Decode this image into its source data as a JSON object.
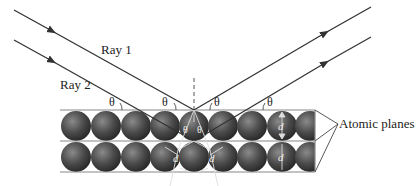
{
  "diagram": {
    "labels": {
      "ray1": "Ray 1",
      "ray2": "Ray 2",
      "theta": "θ",
      "d": "d",
      "atomic_planes": "Atomic planes"
    },
    "colors": {
      "line": "#333333",
      "plane": "#888888",
      "sphere_dark": "#2e2e2e",
      "sphere_light": "#7a7a7a",
      "inner_lines": "#dddddd"
    },
    "layout": {
      "planes_y": [
        110,
        141,
        172
      ],
      "sphere_count_per_row": 9,
      "sphere_diameter": 30,
      "reflection_x": 194
    }
  }
}
